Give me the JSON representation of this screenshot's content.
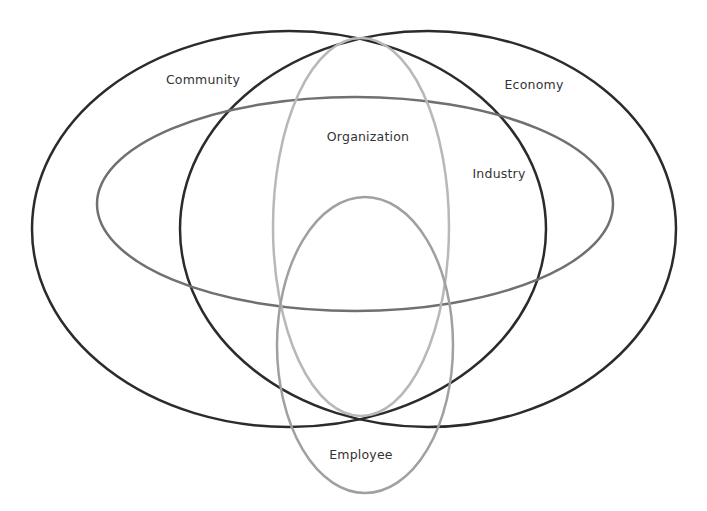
{
  "diagram": {
    "type": "nested-venn",
    "sets": [
      {
        "id": "community",
        "label": "Community",
        "color": "#2b2b2b",
        "cx": 289,
        "cy": 229,
        "rx": 257,
        "ry": 198,
        "stroke": 2.5,
        "label_x": 203,
        "label_y": 79
      },
      {
        "id": "economy",
        "label": "Economy",
        "color": "#2b2b2b",
        "cx": 428,
        "cy": 229,
        "rx": 248,
        "ry": 198,
        "stroke": 2.5,
        "label_x": 534,
        "label_y": 84
      },
      {
        "id": "industry",
        "label": "Industry",
        "color": "#707070",
        "cx": 355,
        "cy": 204,
        "rx": 258,
        "ry": 107,
        "stroke": 2.5,
        "label_x": 499,
        "label_y": 173
      },
      {
        "id": "organization",
        "label": "Organization",
        "color": "#b8b8b8",
        "cx": 361,
        "cy": 227,
        "rx": 88,
        "ry": 189,
        "stroke": 2.5,
        "label_x": 368,
        "label_y": 136
      },
      {
        "id": "employee",
        "label": "Employee",
        "color": "#a0a0a0",
        "cx": 365,
        "cy": 345,
        "rx": 88,
        "ry": 148,
        "stroke": 2.5,
        "label_x": 361,
        "label_y": 454
      }
    ]
  }
}
